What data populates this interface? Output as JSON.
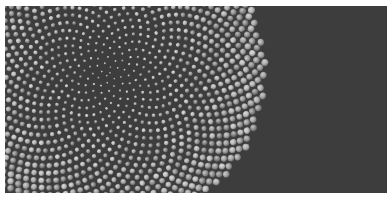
{
  "figure": {
    "kind": "phyllotaxis-sphere-packing",
    "canvas": {
      "width": 391,
      "height": 207,
      "background": "#ffffff"
    },
    "plate": {
      "x": 5,
      "y": 6,
      "width": 382,
      "height": 187
    },
    "background_color": "#8c8c8c"
  },
  "pattern": {
    "type": "vogel-spiral",
    "center": {
      "x": 105,
      "y": 67
    },
    "divergence_angle_deg": 137.508,
    "point_count": 1400,
    "radial_scale": 4.15,
    "radius_base": 0.9,
    "radius_growth": 0.0165,
    "radius_min": 0.75,
    "radius_max": 15.5,
    "packing_fill_ratio": 0.995
  },
  "sphere_shading": {
    "light_direction": {
      "x": -0.42,
      "y": -0.46
    },
    "highlight_color": "#e8e8e8",
    "midtone_color": "#a8a8a8",
    "shadow_color": "#4a4a4a",
    "rim_color": "#3a3a3a",
    "tone_jitter": 0.2,
    "tone_mean": 0.6,
    "gap_color": "#3d3d3d"
  },
  "palette": {
    "lightest": "#f0f0f0",
    "light": "#c9c9c9",
    "mid": "#9a9a9a",
    "dark": "#6b6b6b",
    "darkest": "#343434",
    "paper": "#ffffff"
  }
}
